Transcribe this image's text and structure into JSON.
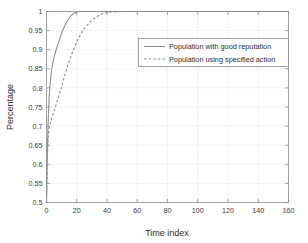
{
  "chart_data": {
    "type": "line",
    "title": "",
    "xlabel": "Time index",
    "ylabel": "Percentage",
    "xlim": [
      0,
      160
    ],
    "ylim": [
      0.5,
      1
    ],
    "grid": true,
    "legend_position": "upper-right-inside",
    "xticks": [
      0,
      20,
      40,
      60,
      80,
      100,
      120,
      140,
      160
    ],
    "xtick_labels": [
      "0",
      "20",
      "40",
      "60",
      "80",
      "100",
      "120",
      "140",
      "160"
    ],
    "yticks": [
      0.5,
      0.55,
      0.6,
      0.65,
      0.7,
      0.75,
      0.8,
      0.85,
      0.9,
      0.95,
      1
    ],
    "ytick_labels": [
      "0.5",
      "0.55",
      "0.6",
      "0.65",
      "0.7",
      "0.75",
      "0.8",
      "0.85",
      "0.9",
      "0.95",
      "1"
    ],
    "series": [
      {
        "name": "Population with good reputation",
        "style": "solid",
        "color": "#8f8f8f",
        "x": [
          0,
          0.5,
          1,
          1.5,
          2,
          2.5,
          3,
          4,
          5,
          6,
          7,
          8,
          9,
          10,
          11,
          12,
          13,
          14,
          15,
          16,
          17,
          18,
          19,
          20,
          22,
          25,
          30,
          40,
          60,
          80,
          100,
          120,
          140,
          160
        ],
        "y": [
          0.5,
          0.62,
          0.7,
          0.755,
          0.79,
          0.815,
          0.835,
          0.862,
          0.88,
          0.895,
          0.908,
          0.92,
          0.932,
          0.943,
          0.953,
          0.962,
          0.97,
          0.977,
          0.983,
          0.988,
          0.992,
          0.995,
          0.997,
          0.999,
          1.0,
          1.0,
          1.0,
          1.0,
          1.0,
          1.0,
          1.0,
          1.0,
          1.0,
          1.0
        ]
      },
      {
        "name": "Population using specified action",
        "style": "dashed",
        "color": "#8f8f8f",
        "x": [
          0,
          0.5,
          1,
          1.5,
          2,
          3,
          4,
          5,
          6,
          7,
          8,
          9,
          10,
          11,
          12,
          13,
          14,
          15,
          16,
          17,
          18,
          19,
          20,
          21,
          22,
          23,
          24,
          25,
          26,
          28,
          30,
          32,
          34,
          36,
          38,
          40,
          50,
          60,
          80,
          100,
          120,
          140,
          160
        ],
        "y": [
          0.5,
          0.6,
          0.665,
          0.69,
          0.7,
          0.715,
          0.728,
          0.74,
          0.752,
          0.764,
          0.776,
          0.79,
          0.803,
          0.818,
          0.832,
          0.845,
          0.858,
          0.87,
          0.881,
          0.892,
          0.902,
          0.911,
          0.92,
          0.928,
          0.936,
          0.943,
          0.949,
          0.955,
          0.96,
          0.969,
          0.977,
          0.983,
          0.988,
          0.992,
          0.996,
          0.998,
          1.0,
          1.0,
          1.0,
          1.0,
          1.0,
          1.0,
          1.0
        ]
      }
    ]
  },
  "legend": {
    "entries": [
      {
        "label": "Population with good reputation",
        "style": "solid"
      },
      {
        "label": "Population using specified action",
        "style": "dashed"
      }
    ]
  }
}
